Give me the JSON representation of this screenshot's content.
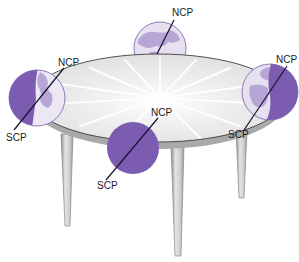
{
  "diagram": {
    "colors": {
      "night": "#7b5cb0",
      "day": "#e6e0f0",
      "land_day": "#b5a6d6",
      "land_night": "#a78fd0",
      "outline": "#8c7bb8",
      "axis": "#1a1030",
      "table_top": "#eeeeee",
      "table_edge": "#9a9a9a",
      "leg": "#c8c8c8",
      "leg_shadow": "#8e8e8e"
    },
    "globes": [
      {
        "position": "back",
        "ncp_label": "NCP",
        "scp_label": null,
        "lighting": "day"
      },
      {
        "position": "left",
        "ncp_label": "NCP",
        "scp_label": "SCP",
        "lighting": "left-half-night"
      },
      {
        "position": "right",
        "ncp_label": "NCP",
        "scp_label": "SCP",
        "lighting": "right-half-night"
      },
      {
        "position": "front",
        "ncp_label": "NCP",
        "scp_label": "SCP",
        "lighting": "night"
      }
    ],
    "labels": {
      "back_ncp": "NCP",
      "left_ncp": "NCP",
      "left_scp": "SCP",
      "right_ncp": "NCP",
      "right_scp": "SCP",
      "front_ncp": "NCP",
      "front_scp": "SCP"
    },
    "center_object": "light-source"
  }
}
